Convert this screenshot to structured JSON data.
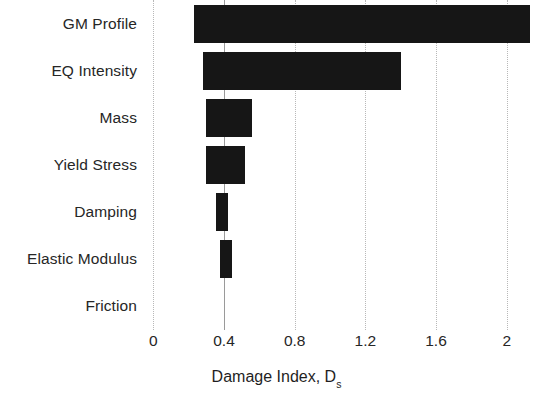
{
  "chart_data": {
    "type": "bar",
    "orientation": "horizontal",
    "title": "",
    "subtitle": "",
    "xlabel": "Damage Index, D",
    "xlabel_subscript": "s",
    "ylabel": "",
    "categories": [
      "GM Profile",
      "EQ Intensity",
      "Mass",
      "Yield Stress",
      "Damping",
      "Elastic Modulus",
      "Friction"
    ],
    "bar_start_values": [
      0.23,
      0.28,
      0.3,
      0.3,
      0.355,
      0.38,
      0.4
    ],
    "bar_end_values": [
      2.13,
      1.4,
      0.56,
      0.52,
      0.42,
      0.445,
      0.4
    ],
    "bar_spans": [
      1.9,
      1.12,
      0.26,
      0.22,
      0.065,
      0.065,
      0.0
    ],
    "baseline_value": 0.4,
    "xlim": [
      0,
      2.0
    ],
    "xticks": [
      0,
      0.4,
      0.8,
      1.2,
      1.6,
      2
    ],
    "xtick_labels": [
      "0",
      "0.4",
      "0.8",
      "1.2",
      "1.6",
      "2"
    ],
    "grid": "vertical-dotted",
    "legend": "none",
    "bar_color": "#161616",
    "grid_color": "#b8b8b8",
    "text_color": "#262626",
    "background": "#ffffff"
  }
}
